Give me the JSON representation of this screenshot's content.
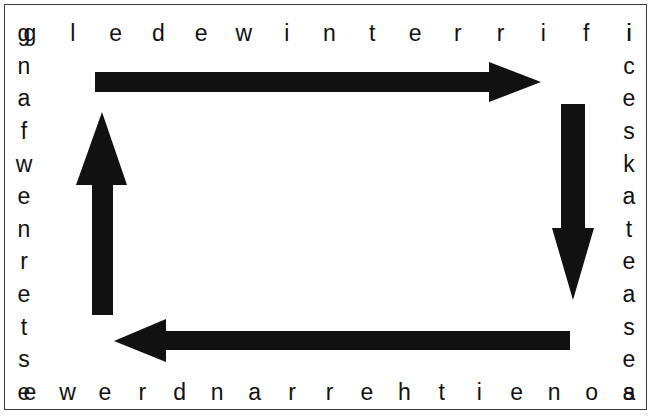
{
  "canvas": {
    "width": 652,
    "height": 416,
    "background": "#ffffff"
  },
  "frame": {
    "border_color": "#3a3a3a",
    "border_width": 1.5
  },
  "colors": {
    "ink": "#111111",
    "arrow": "#111111",
    "frame": "#3a3a3a",
    "background": "#ffffff"
  },
  "puzzle": {
    "type": "letter-ring",
    "reading_direction": "clockwise",
    "top_row": {
      "text": "gledewinterrifi",
      "letters": [
        "g",
        "l",
        "e",
        "d",
        "e",
        "w",
        "i",
        "n",
        "t",
        "e",
        "r",
        "r",
        "i",
        "f",
        "i"
      ]
    },
    "right_column": {
      "text": "icesk ateasea",
      "letters": [
        "i",
        "c",
        "e",
        "s",
        "k",
        "a",
        "t",
        "e",
        "a",
        "s",
        "e",
        "a"
      ]
    },
    "bottom_row": {
      "text": "ewerdnarrehtienos",
      "letters": [
        "e",
        "w",
        "e",
        "r",
        "d",
        "n",
        "a",
        "r",
        "r",
        "e",
        "h",
        "t",
        "i",
        "e",
        "n",
        "o",
        "s"
      ]
    },
    "left_column": {
      "text": "gnafwenretse",
      "letters": [
        "g",
        "n",
        "a",
        "f",
        "w",
        "e",
        "n",
        "r",
        "e",
        "t",
        "s",
        "e"
      ]
    },
    "ring_sequence": "gledewinterrificeskateaseasonEitherrandrewewEstenwafng",
    "decoded_clockwise": "gledewinterrific iceskateasea sonei htherrandrewe estrenwafng"
  },
  "arrows": [
    {
      "name": "top-arrow-right",
      "direction": "right",
      "from_x": 95,
      "to_x": 540,
      "y": 82,
      "shaft_thickness": 19
    },
    {
      "name": "right-arrow-down",
      "direction": "down",
      "x": 572,
      "from_y": 104,
      "to_y": 300,
      "shaft_thickness": 24
    },
    {
      "name": "bottom-arrow-left",
      "direction": "left",
      "from_x": 570,
      "to_x": 114,
      "y": 340,
      "shaft_thickness": 18
    },
    {
      "name": "left-arrow-up",
      "direction": "up",
      "x": 101,
      "from_y": 315,
      "to_y": 112,
      "shaft_thickness": 21
    }
  ]
}
